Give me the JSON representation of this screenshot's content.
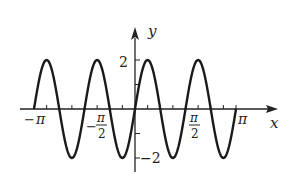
{
  "chart_data": {
    "type": "line",
    "title": "",
    "function": "y = 2 sin(4x)",
    "xlabel": "x",
    "ylabel": "y",
    "xlim": [
      -3.14159,
      3.14159
    ],
    "ylim": [
      -2,
      2
    ],
    "x_tick_labels": [
      "−π",
      "−π/2",
      "π/2",
      "π"
    ],
    "y_tick_labels": [
      "2",
      "−2"
    ],
    "grid": false,
    "series": [
      {
        "name": "y = 2 sin 4x",
        "amplitude": 2,
        "frequency": 4,
        "x_range": [
          -3.14159,
          3.14159
        ]
      }
    ]
  },
  "labels": {
    "x_axis": "x",
    "y_axis": "y",
    "neg_pi_sign": "−",
    "pi": "π",
    "half_num": "π",
    "half_den": "2",
    "y_max": "2",
    "y_min": "−2"
  },
  "colors": {
    "curve": "#1a1a1a",
    "axis": "#222222"
  }
}
